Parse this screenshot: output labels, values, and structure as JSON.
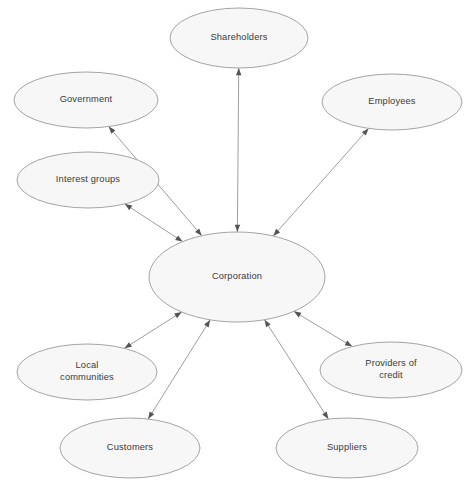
{
  "diagram": {
    "type": "hub-and-spoke relationship diagram",
    "canvas": {
      "width": 474,
      "height": 490,
      "background": "#ffffff"
    },
    "style": {
      "node_fill": "#f7f7f7",
      "node_stroke": "#9a9a9a",
      "edge_stroke": "#8d8d8d",
      "arrow_fill": "#545454",
      "label_color": "#3a3a3a"
    },
    "center": {
      "id": "corporation",
      "label": "Corporation",
      "cx": 237,
      "cy": 277,
      "rx": 88,
      "ry": 45
    },
    "nodes": [
      {
        "id": "shareholders",
        "label": "Shareholders",
        "lines": [
          "Shareholders"
        ],
        "cx": 239,
        "cy": 38,
        "rx": 69,
        "ry": 30
      },
      {
        "id": "government",
        "label": "Government",
        "lines": [
          "Government"
        ],
        "cx": 86,
        "cy": 100,
        "rx": 72,
        "ry": 28
      },
      {
        "id": "employees",
        "label": "Employees",
        "lines": [
          "Employees"
        ],
        "cx": 392,
        "cy": 102,
        "rx": 70,
        "ry": 28
      },
      {
        "id": "interest-groups",
        "label": "Interest groups",
        "lines": [
          "Interest groups"
        ],
        "cx": 88,
        "cy": 180,
        "rx": 71,
        "ry": 28
      },
      {
        "id": "local-communities",
        "label": "Local communities",
        "lines": [
          "Local",
          "communities"
        ],
        "cx": 87,
        "cy": 372,
        "rx": 70,
        "ry": 28
      },
      {
        "id": "providers-of-credit",
        "label": "Providers of credit",
        "lines": [
          "Providers of",
          "credit"
        ],
        "cx": 391,
        "cy": 370,
        "rx": 71,
        "ry": 28
      },
      {
        "id": "customers",
        "label": "Customers",
        "lines": [
          "Customers"
        ],
        "cx": 130,
        "cy": 448,
        "rx": 70,
        "ry": 30
      },
      {
        "id": "suppliers",
        "label": "Suppliers",
        "lines": [
          "Suppliers"
        ],
        "cx": 347,
        "cy": 448,
        "rx": 71,
        "ry": 30
      }
    ],
    "edges": [
      {
        "id": "edge-corporation-shareholders",
        "from": "corporation",
        "to": "shareholders",
        "direction": "bidirectional"
      },
      {
        "id": "edge-corporation-government",
        "from": "corporation",
        "to": "government",
        "direction": "bidirectional"
      },
      {
        "id": "edge-corporation-employees",
        "from": "corporation",
        "to": "employees",
        "direction": "bidirectional"
      },
      {
        "id": "edge-corporation-interest-groups",
        "from": "corporation",
        "to": "interest-groups",
        "direction": "bidirectional"
      },
      {
        "id": "edge-corporation-local-communities",
        "from": "corporation",
        "to": "local-communities",
        "direction": "bidirectional"
      },
      {
        "id": "edge-corporation-providers-of-credit",
        "from": "corporation",
        "to": "providers-of-credit",
        "direction": "bidirectional"
      },
      {
        "id": "edge-corporation-customers",
        "from": "corporation",
        "to": "customers",
        "direction": "bidirectional"
      },
      {
        "id": "edge-corporation-suppliers",
        "from": "corporation",
        "to": "suppliers",
        "direction": "bidirectional"
      }
    ]
  }
}
